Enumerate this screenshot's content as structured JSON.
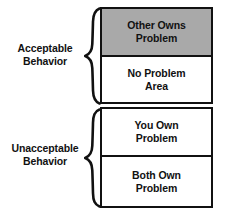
{
  "diagram": {
    "colors": {
      "shaded_box_fill": "#a9a9a9",
      "plain_box_fill": "#ffffff",
      "stroke": "#111111",
      "background": "#ffffff",
      "text": "#111111"
    },
    "groups": [
      {
        "id": "acceptable",
        "label_line1": "Acceptable",
        "label_line2": "Behavior",
        "brace": "left-curly-brace",
        "boxes": [
          {
            "id": "other-owns-problem",
            "line1": "Other Owns",
            "line2": "Problem",
            "shaded": true
          },
          {
            "id": "no-problem-area",
            "line1": "No Problem",
            "line2": "Area",
            "shaded": false
          }
        ]
      },
      {
        "id": "unacceptable",
        "label_line1": "Unacceptable",
        "label_line2": "Behavior",
        "brace": "left-curly-brace",
        "boxes": [
          {
            "id": "you-own-problem",
            "line1": "You Own",
            "line2": "Problem",
            "shaded": false
          },
          {
            "id": "both-own-problem",
            "line1": "Both Own",
            "line2": "Problem",
            "shaded": false
          }
        ]
      }
    ]
  }
}
